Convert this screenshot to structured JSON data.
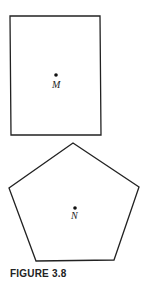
{
  "figure": {
    "caption": "FIGURE 3.8",
    "shapes": [
      {
        "type": "rectangle",
        "center_point": {
          "label": "M"
        }
      },
      {
        "type": "regular-pentagon",
        "center_point": {
          "label": "N"
        }
      }
    ]
  }
}
